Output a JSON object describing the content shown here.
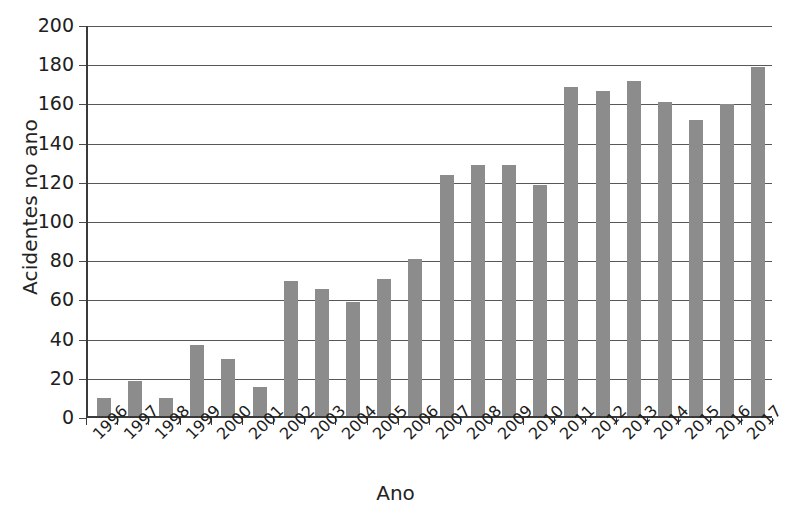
{
  "chart_data": {
    "type": "bar",
    "title": "",
    "xlabel": "Ano",
    "ylabel": "Acidentes no ano",
    "categories": [
      "1996",
      "1997",
      "1998",
      "1999",
      "2000",
      "2001",
      "2002",
      "2003",
      "2004",
      "2005",
      "2006",
      "2007",
      "2008",
      "2009",
      "2010",
      "2011",
      "2012",
      "2013",
      "2014",
      "2015",
      "2016",
      "2017"
    ],
    "values": [
      9,
      18,
      9,
      36,
      29,
      15,
      69,
      65,
      58,
      70,
      80,
      123,
      128,
      128,
      118,
      168,
      166,
      171,
      160,
      151,
      159,
      178
    ],
    "ylim": [
      0,
      200
    ],
    "ytick_step": 20,
    "yticks": [
      0,
      20,
      40,
      60,
      80,
      100,
      120,
      140,
      160,
      180,
      200
    ],
    "ytick_labels": [
      "0",
      "20",
      "40",
      "60",
      "80",
      "100",
      "120",
      "140",
      "160",
      "180",
      "200"
    ],
    "grid": true,
    "legend": false,
    "legend_position": "none",
    "bar_color": "#8c8c8c",
    "axis_color": "#3a3a3a",
    "grid_color": "#585858",
    "xtick_rotation": -45
  },
  "caption": {
    "text": ""
  }
}
